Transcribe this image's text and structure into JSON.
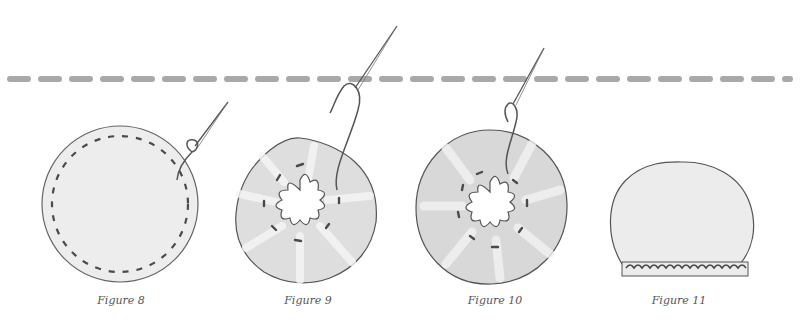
{
  "diagram": {
    "cut_line": {
      "color": "#a9a9a9",
      "y": 79
    },
    "colors": {
      "fabric": "#ececec",
      "fabric_shadow": "#d3d3d3",
      "outline": "#555555",
      "stitch": "#4a4a4a",
      "thread": "#666666"
    },
    "figures": [
      {
        "id": "figure-8",
        "label": "Figure 8",
        "cx": 120,
        "caption_x": 121
      },
      {
        "id": "figure-9",
        "label": "Figure 9",
        "cx": 302,
        "caption_x": 308
      },
      {
        "id": "figure-10",
        "label": "Figure 10",
        "cx": 491,
        "caption_x": 495
      },
      {
        "id": "figure-11",
        "label": "Figure 11",
        "cx": 679,
        "caption_x": 679
      }
    ]
  }
}
